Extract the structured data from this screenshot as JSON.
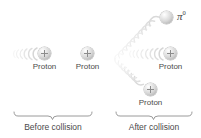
{
  "figure": {
    "background_color": "#ffffff",
    "text_color": "#4a4a4a",
    "particle_color": "#d8d8d8",
    "trail_color": "#e6e6e6",
    "brace_color": "#8a8a8a"
  },
  "before": {
    "group_label": "Before collision",
    "particles": [
      {
        "name": "proton-incoming",
        "label": "Proton",
        "charge": "+",
        "x": 44,
        "y": 54,
        "moving": true,
        "motion": "right",
        "trail_angle_deg": 0
      },
      {
        "name": "proton-target",
        "label": "Proton",
        "charge": "+",
        "x": 87,
        "y": 54,
        "moving": false,
        "motion": "none",
        "trail_angle_deg": 0
      }
    ]
  },
  "after": {
    "group_label": "After collision",
    "particles": [
      {
        "name": "pion-neutral",
        "label": "π",
        "label_superscript": "0",
        "charge": "0",
        "x": 166,
        "y": 18,
        "moving": true,
        "motion": "up-right",
        "trail_angle_deg": -42
      },
      {
        "name": "proton-scattered-right",
        "label": "Proton",
        "charge": "+",
        "x": 170,
        "y": 54,
        "moving": true,
        "motion": "right",
        "trail_angle_deg": 0
      },
      {
        "name": "proton-scattered-down",
        "label": "Proton",
        "charge": "+",
        "x": 150,
        "y": 90,
        "moving": true,
        "motion": "down-right",
        "trail_angle_deg": 40
      }
    ]
  },
  "braces": [
    {
      "name": "brace-before",
      "left": 13,
      "right": 92,
      "y": 114,
      "label": "Before collision",
      "label_y": 120
    },
    {
      "name": "brace-after",
      "left": 115,
      "right": 192,
      "y": 114,
      "label": "After collision",
      "label_y": 120
    }
  ]
}
